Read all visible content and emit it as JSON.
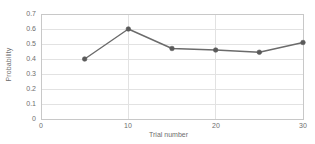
{
  "chart_data": {
    "type": "line",
    "title": "",
    "xlabel": "Trial number",
    "ylabel": "Probability",
    "x": [
      5,
      10,
      15,
      20,
      25,
      30
    ],
    "values": [
      0.4,
      0.6,
      0.47,
      0.46,
      0.445,
      0.51
    ],
    "series": [
      {
        "name": "Probability",
        "x": [
          5,
          10,
          15,
          20,
          25,
          30
        ],
        "values": [
          0.4,
          0.6,
          0.47,
          0.46,
          0.445,
          0.51
        ]
      }
    ],
    "xlim": [
      0,
      30
    ],
    "ylim": [
      0,
      0.7
    ],
    "xticks": [
      "0",
      "10",
      "20",
      "30"
    ],
    "xtick_values": [
      0,
      10,
      20,
      30
    ],
    "yticks": [
      "0",
      "0.1",
      "0.2",
      "0.3",
      "0.4",
      "0.5",
      "0.6",
      "0.7"
    ],
    "ytick_values": [
      0,
      0.1,
      0.2,
      0.3,
      0.4,
      0.5,
      0.6,
      0.7
    ],
    "grid": "horizontal",
    "legend": "none",
    "line_color": "#6b6b6b",
    "marker_color": "#5a5a5a",
    "grid_color": "#e2e2e2",
    "axis_color": "#c8c8c8",
    "tick_text_color": "#6e6e6e",
    "background": "#ffffff"
  }
}
